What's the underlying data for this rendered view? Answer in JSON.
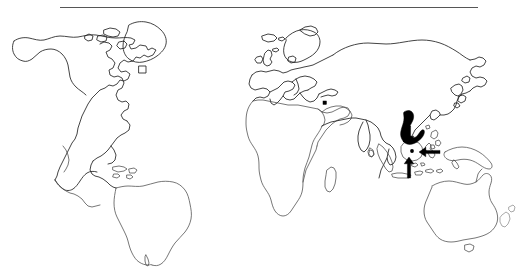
{
  "figure": {
    "type": "distribution-map",
    "title": "",
    "caption": "",
    "background_color": "#ffffff",
    "outline_color": "#4a4a4a",
    "highlight_color": "#000000",
    "rule": {
      "name": "horizontal-rule",
      "color": "#565656",
      "x_start": 60,
      "x_end": 478,
      "y": 7,
      "thickness": 1.6
    },
    "projection_note": "equirectangular world outline",
    "landmasses": [
      {
        "id": "north-america",
        "label": "North America"
      },
      {
        "id": "greenland",
        "label": "Greenland"
      },
      {
        "id": "south-america",
        "label": "South America"
      },
      {
        "id": "caribbean",
        "label": "Caribbean Islands"
      },
      {
        "id": "europe",
        "label": "Europe"
      },
      {
        "id": "british-isles",
        "label": "British Isles"
      },
      {
        "id": "iceland",
        "label": "Iceland"
      },
      {
        "id": "africa",
        "label": "Africa"
      },
      {
        "id": "madagascar",
        "label": "Madagascar"
      },
      {
        "id": "arabia",
        "label": "Arabian Peninsula"
      },
      {
        "id": "asia",
        "label": "Asia"
      },
      {
        "id": "india",
        "label": "Indian Subcontinent"
      },
      {
        "id": "japan",
        "label": "Japan"
      },
      {
        "id": "philippines",
        "label": "Philippines"
      },
      {
        "id": "borneo",
        "label": "Borneo"
      },
      {
        "id": "sumatra",
        "label": "Sumatra"
      },
      {
        "id": "java",
        "label": "Java"
      },
      {
        "id": "sulawesi",
        "label": "Sulawesi"
      },
      {
        "id": "new-guinea",
        "label": "New Guinea"
      },
      {
        "id": "australia",
        "label": "Australia"
      },
      {
        "id": "new-zealand",
        "label": "New Zealand"
      },
      {
        "id": "tasmania",
        "label": "Tasmania"
      },
      {
        "id": "sri-lanka",
        "label": "Sri Lanka"
      }
    ],
    "shaded_regions": [
      {
        "id": "indochina-shaded",
        "label": "Indochina shaded range",
        "color": "#000000",
        "approx_center": [
          411,
          123
        ]
      }
    ],
    "markers": [
      {
        "id": "locality-dot-1",
        "label": "locality marker",
        "x": 412,
        "y": 151,
        "radius": 1.9
      },
      {
        "id": "locality-dot-2",
        "label": "locality marker",
        "x": 425,
        "y": 151,
        "radius": 1.6
      },
      {
        "id": "locality-dot-3",
        "label": "locality marker",
        "x": 404,
        "y": 141,
        "radius": 1.2
      }
    ],
    "arrows": [
      {
        "id": "arrow-borneo",
        "label": "arrow pointing down to Borneo",
        "direction": "down",
        "tail": [
          409,
          126
        ],
        "head": [
          409,
          143
        ]
      },
      {
        "id": "arrow-sulawesi",
        "label": "arrow pointing left to Sulawesi",
        "direction": "left",
        "tail": [
          440,
          152
        ],
        "head": [
          419,
          152
        ]
      },
      {
        "id": "arrow-java",
        "label": "arrow pointing up to Java",
        "direction": "up",
        "tail": [
          409,
          178
        ],
        "head": [
          409,
          157
        ]
      }
    ]
  }
}
